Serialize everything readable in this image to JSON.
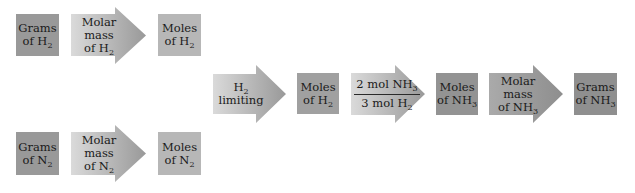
{
  "colors": {
    "box_dark": "#999999",
    "box_light": "#b7b7b7",
    "arrow_gradient_start": "#dadada",
    "arrow_gradient_end": "#9a9a9a",
    "text": "#1a1a1a",
    "background": "#ffffff"
  },
  "top_row": {
    "grams": {
      "line1": "Grams",
      "line2_prefix": "of H",
      "line2_sub": "2"
    },
    "arrow": {
      "line1": "Molar",
      "line2": "mass",
      "line3_prefix": "of H",
      "line3_sub": "2"
    },
    "moles": {
      "line1": "Moles",
      "line2_prefix": "of H",
      "line2_sub": "2"
    }
  },
  "bottom_row": {
    "grams": {
      "line1": "Grams",
      "line2_prefix": "of N",
      "line2_sub": "2"
    },
    "arrow": {
      "line1": "Molar",
      "line2": "mass",
      "line3_prefix": "of N",
      "line3_sub": "2"
    },
    "moles": {
      "line1": "Moles",
      "line2_prefix": "of N",
      "line2_sub": "2"
    }
  },
  "main_chain": {
    "limiting_arrow": {
      "line1_prefix": "H",
      "line1_sub": "2",
      "line2": "limiting"
    },
    "moles_h2": {
      "line1": "Moles",
      "line2_prefix": "of H",
      "line2_sub": "2"
    },
    "ratio_arrow": {
      "numerator_prefix": "2 mol NH",
      "numerator_sub": "3",
      "denominator_prefix": "3 mol H",
      "denominator_sub": "2"
    },
    "moles_nh3": {
      "line1": "Moles",
      "line2_prefix": "of NH",
      "line2_sub": "3"
    },
    "molar_mass_arrow": {
      "line1": "Molar",
      "line2": "mass",
      "line3_prefix": "of NH",
      "line3_sub": "3"
    },
    "grams_nh3": {
      "line1": "Grams",
      "line2_prefix": "of NH",
      "line2_sub": "3"
    }
  }
}
